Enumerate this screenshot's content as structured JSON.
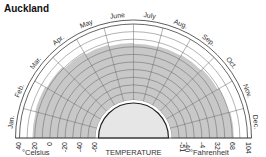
{
  "title": "Auckland",
  "chart_data": {
    "type": "area",
    "subtype": "polar-semicircle",
    "title": "Auckland",
    "center_label": "TEMPERATURE",
    "categories": [
      "Jan.",
      "Feb.",
      "Mar.",
      "Apr.",
      "May",
      "June",
      "July",
      "Aug.",
      "Sep.",
      "Oct.",
      "Nov.",
      "Dec."
    ],
    "series": [
      {
        "name": "Max temperature (°C)",
        "values": [
          23,
          24,
          22,
          19,
          17,
          15,
          14,
          15,
          16,
          18,
          20,
          22
        ]
      }
    ],
    "axis_celsius": {
      "label": "°Celsius",
      "ticks": [
        "40",
        "20",
        "0",
        "-20",
        "-40",
        "-60"
      ],
      "range": [
        -60,
        40
      ]
    },
    "axis_fahrenheit": {
      "label": "°Fahrenheit",
      "ticks": [
        "-51",
        "-40",
        "-4",
        "32",
        "68",
        "104"
      ],
      "range": [
        -76,
        104
      ]
    },
    "grid": true,
    "ring_step_c": 10,
    "colors": {
      "fill": "#c8c8c8",
      "grid": "#555555",
      "inner": "#e6e6e6"
    }
  }
}
